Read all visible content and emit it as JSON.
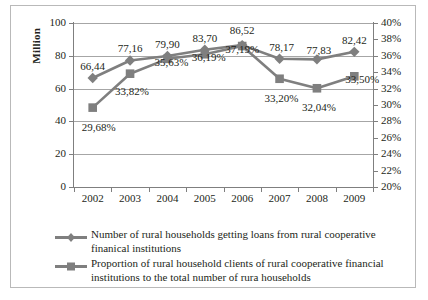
{
  "chart_data": {
    "type": "line",
    "title": "",
    "xlabel": "",
    "ylabel": "Million",
    "ylabel_right": "",
    "categories": [
      "2002",
      "2003",
      "2004",
      "2005",
      "2006",
      "2007",
      "2008",
      "2009"
    ],
    "ylim": [
      0,
      100
    ],
    "yticks": [
      "0",
      "20",
      "40",
      "60",
      "80",
      "100"
    ],
    "ylim_right": [
      20,
      40
    ],
    "yticks_right": [
      "20%",
      "22%",
      "24%",
      "26%",
      "28%",
      "30%",
      "32%",
      "34%",
      "36%",
      "38%",
      "40%"
    ],
    "grid": true,
    "legend_position": "bottom-left",
    "series": [
      {
        "name": "Number of rural households getting loans from rural cooperative finanical institutions",
        "marker": "diamond",
        "axis": "left",
        "color": "#7f7f7f",
        "values": [
          66.44,
          77.16,
          79.9,
          83.7,
          86.52,
          78.17,
          77.83,
          82.42
        ],
        "labels": [
          "66,44",
          "77,16",
          "79,90",
          "83,70",
          "86,52",
          "78,17",
          "77,83",
          "82,42"
        ]
      },
      {
        "name": "Proportion of rural household clients of rural cooperative financial institutions to the total number of rura households",
        "marker": "square",
        "axis": "right",
        "color": "#7f7f7f",
        "values": [
          29.68,
          33.82,
          35.63,
          36.19,
          37.19,
          33.2,
          32.04,
          33.5
        ],
        "labels": [
          "29,68%",
          "33,82%",
          "35,63%",
          "36,19%",
          "37,19%",
          "33,20%",
          "32,04%",
          "33,50%"
        ]
      }
    ]
  },
  "axis_title_left": "Million",
  "legend": {
    "items": [
      {
        "marker": "diamond",
        "label": "Number of rural households getting loans from rural cooperative finanical institutions"
      },
      {
        "marker": "square",
        "label": "Proportion of rural household clients of rural cooperative financial institutions to the total number of rura households"
      }
    ]
  }
}
